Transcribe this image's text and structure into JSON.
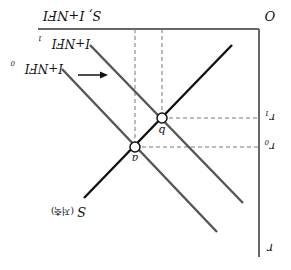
{
  "orientation": "rotated-180",
  "axes": {
    "origin_label": "O",
    "vertical_axis_label": "r",
    "horizontal_axis_label": "S, I+NFI"
  },
  "curves": {
    "saving": {
      "label": "S",
      "label_note": "(저축)",
      "color": "#111111"
    },
    "investment_nfi_0": {
      "label": "I+NFI",
      "subscript": "0",
      "color": "#555555"
    },
    "investment_nfi_1": {
      "label": "I+NFI",
      "subscript": "1",
      "color": "#555555"
    }
  },
  "points": {
    "a": {
      "label": "a",
      "rate_label": "r",
      "rate_subscript": "0"
    },
    "b": {
      "label": "b",
      "rate_label": "r",
      "rate_subscript": "1"
    }
  },
  "shift_arrow": {
    "direction": "right",
    "meaning": "I+NFI0 to I+NFI1"
  },
  "colors": {
    "axis": "#666666",
    "dash": "#777777",
    "curve_dark": "#111111",
    "curve_gray": "#555555"
  }
}
